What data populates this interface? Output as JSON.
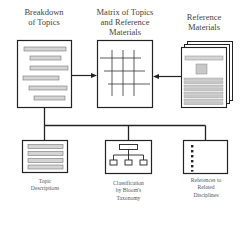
{
  "top_nodes": {
    "breakdown": {
      "label_line1": "Breakdown",
      "label_line2": "of Topics",
      "icon": "list-document-icon"
    },
    "matrix": {
      "label_line1": "Matrix of Topics",
      "label_line2": "and Reference",
      "label_line3": "Materials",
      "icon": "grid-matrix-icon"
    },
    "reference": {
      "label_line1": "Reference",
      "label_line2": "Materials",
      "icon": "stacked-documents-icon"
    }
  },
  "bottom_nodes": {
    "topic_descriptions": {
      "label_line1": "Topic",
      "label_line2": "Descriptions",
      "icon": "text-lines-icon"
    },
    "classification": {
      "label_line1": "Classification",
      "label_line2": "by Bloom's",
      "label_line3": "Taxonomy",
      "icon": "hierarchy-tree-icon"
    },
    "related_disciplines": {
      "label_line1": "References to",
      "label_line2": "Related",
      "label_line3": "Disciplines",
      "icon": "bullet-list-icon"
    }
  },
  "edges": [
    {
      "from": "breakdown",
      "to": "matrix",
      "type": "arrow"
    },
    {
      "from": "reference",
      "to": "matrix",
      "type": "arrow"
    },
    {
      "from": "breakdown",
      "to": "topic_descriptions",
      "type": "line"
    },
    {
      "from": "breakdown",
      "to": "classification",
      "type": "line"
    },
    {
      "from": "breakdown",
      "to": "related_disciplines",
      "type": "line"
    }
  ],
  "colors": {
    "stroke": "#222222",
    "bar_fill": "#d4d4d4",
    "bar_stroke": "#777777",
    "background": "#ffffff"
  }
}
